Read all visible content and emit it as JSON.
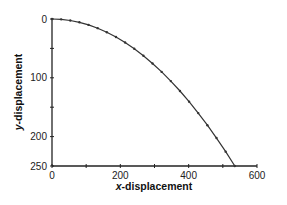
{
  "chart_data": {
    "type": "line",
    "title": "",
    "xlabel": "x-displacement",
    "ylabel": "y-displacement",
    "xlim": [
      0,
      600
    ],
    "ylim": [
      250,
      0
    ],
    "y_inverted": true,
    "grid": false,
    "legend": null,
    "x_ticks": [
      0,
      200,
      400,
      600
    ],
    "x_minor_ticks": [
      100,
      300,
      500
    ],
    "y_ticks": [
      0,
      100,
      200,
      250
    ],
    "y_minor_ticks": [
      50,
      150
    ],
    "series": [
      {
        "name": "trajectory",
        "marker": "dot",
        "x": [
          0,
          26.75,
          53.5,
          80.25,
          107,
          133.75,
          160.5,
          187.25,
          214,
          240.75,
          267.5,
          294.25,
          321,
          347.75,
          374.5,
          401.25,
          428,
          454.75,
          481.5,
          508.25,
          535
        ],
        "y": [
          0,
          0.6,
          2.5,
          5.6,
          10,
          15.6,
          22.5,
          30.6,
          40,
          50.6,
          62.5,
          75.6,
          90,
          105.6,
          122.5,
          140.6,
          160,
          180.6,
          202.5,
          225.6,
          250
        ]
      }
    ]
  },
  "labels": {
    "x_title_prefix": "x",
    "x_title_rest": "-displacement",
    "y_title_prefix": "y",
    "y_title_rest": "-displacement"
  },
  "colors": {
    "line": "#333333",
    "axis": "#222222"
  }
}
